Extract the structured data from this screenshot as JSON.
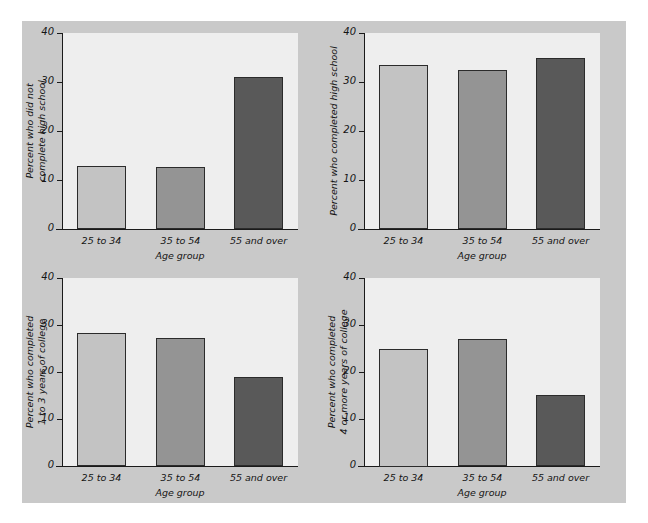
{
  "figure": {
    "background": "#ffffff",
    "mat_color": "#c9c9c9",
    "plot_background": "#eeeeee",
    "axis_color": "#1a1a1a"
  },
  "palette": {
    "light": "#c3c3c3",
    "medium": "#949494",
    "dark": "#595959",
    "bar_outline": "#2b2b2b"
  },
  "shared": {
    "xlabel": "Age group",
    "categories": [
      "25 to 34",
      "35 to 54",
      "55 and over"
    ],
    "yticks": [
      "0",
      "10",
      "20",
      "30",
      "40"
    ],
    "ylim": [
      0,
      40
    ]
  },
  "chart_data": [
    {
      "type": "bar",
      "title": "",
      "ylabel": "Percent who did not complete high school",
      "ylabel_lines": [
        "Percent who did not",
        "complete high school"
      ],
      "xlabel": "Age group",
      "categories": [
        "25 to 34",
        "35 to 54",
        "55 and over"
      ],
      "values": [
        12.8,
        12.7,
        31.0
      ],
      "colors": [
        "#c3c3c3",
        "#949494",
        "#595959"
      ],
      "ylim": [
        0,
        40
      ],
      "yticks": [
        0,
        10,
        20,
        30,
        40
      ],
      "grid": false,
      "legend": "none"
    },
    {
      "type": "bar",
      "title": "",
      "ylabel": "Percent who completed high school",
      "ylabel_lines": [
        "Percent who completed high school"
      ],
      "xlabel": "Age group",
      "categories": [
        "25 to 34",
        "35 to 54",
        "55 and over"
      ],
      "values": [
        33.4,
        32.4,
        34.8
      ],
      "colors": [
        "#c3c3c3",
        "#949494",
        "#595959"
      ],
      "ylim": [
        0,
        40
      ],
      "yticks": [
        0,
        10,
        20,
        30,
        40
      ],
      "grid": false,
      "legend": "none"
    },
    {
      "type": "bar",
      "title": "",
      "ylabel": "Percent who completed 1 to 3 years of college",
      "ylabel_lines": [
        "Percent who completed",
        "1 to 3 years of college"
      ],
      "xlabel": "Age group",
      "categories": [
        "25 to 34",
        "35 to 54",
        "55 and over"
      ],
      "values": [
        28.3,
        27.3,
        19.0
      ],
      "colors": [
        "#c3c3c3",
        "#949494",
        "#595959"
      ],
      "ylim": [
        0,
        40
      ],
      "yticks": [
        0,
        10,
        20,
        30,
        40
      ],
      "grid": false,
      "legend": "none"
    },
    {
      "type": "bar",
      "title": "",
      "ylabel": "Percent who completed 4 or more years of college",
      "ylabel_lines": [
        "Percent who completed",
        "4 or more years of college"
      ],
      "xlabel": "Age group",
      "categories": [
        "25 to 34",
        "35 to 54",
        "55 and over"
      ],
      "values": [
        25.0,
        27.0,
        15.2
      ],
      "colors": [
        "#c3c3c3",
        "#949494",
        "#595959"
      ],
      "ylim": [
        0,
        40
      ],
      "yticks": [
        0,
        10,
        20,
        30,
        40
      ],
      "grid": false,
      "legend": "none"
    }
  ]
}
